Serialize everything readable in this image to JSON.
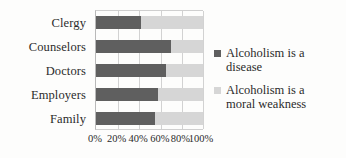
{
  "chart_data": {
    "type": "bar",
    "orientation": "horizontal",
    "stacked": true,
    "title": "",
    "xlabel": "",
    "ylabel": "",
    "categories": [
      "Clergy",
      "Counselors",
      "Doctors",
      "Employers",
      "Family"
    ],
    "series": [
      {
        "name": "Alcoholism is a disease",
        "color": "#5f5f5f",
        "values": [
          42,
          70,
          65,
          58,
          55
        ]
      },
      {
        "name": "Alcoholism is a moral weakness",
        "color": "#d6d6d6",
        "values": [
          58,
          30,
          35,
          42,
          45
        ]
      }
    ],
    "xlim": [
      0,
      100
    ],
    "xticks": [
      0,
      20,
      40,
      60,
      80,
      100
    ],
    "xtick_labels": [
      "0%",
      "20%",
      "40%",
      "60%",
      "80%",
      "100%"
    ],
    "grid": true,
    "legend_position": "right"
  },
  "legend": {
    "entries": [
      {
        "label_line1": "Alcoholism is a",
        "label_line2": "disease"
      },
      {
        "label_line1": "Alcoholism is a",
        "label_line2": "moral weakness"
      }
    ]
  },
  "colors": {
    "series_a": "#5f5f5f",
    "series_b": "#d6d6d6",
    "gridline": "#d2d2d2",
    "axis": "#b9b9b9",
    "text": "#2b2b2b",
    "background": "#fdfdfc"
  }
}
